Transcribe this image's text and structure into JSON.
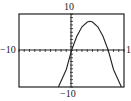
{
  "chart_data": {
    "type": "line",
    "title": "",
    "xlabel": "",
    "ylabel": "",
    "xlim": [
      -10,
      10
    ],
    "ylim": [
      -10,
      10
    ],
    "grid": false,
    "axis_ticks": "unit tick marks along both axes",
    "tick_labels": {
      "top": "10",
      "bottom": "-10",
      "left": "-10",
      "right": "1"
    },
    "series": [
      {
        "name": "parabola",
        "equation": "downward-opening parabola through origin, vertex near (3.5, 8)",
        "x": [
          -2.5,
          -1,
          0,
          1,
          2,
          3,
          3.5,
          4,
          5,
          6,
          7,
          8,
          9.5
        ],
        "y": [
          -10,
          -5.2,
          0,
          3.9,
          6.5,
          7.8,
          8,
          7.8,
          6.5,
          3.9,
          0,
          -5.2,
          -10
        ]
      }
    ]
  },
  "labels": {
    "top": "10",
    "bottom": "−10",
    "left": "−10",
    "right": "1"
  }
}
